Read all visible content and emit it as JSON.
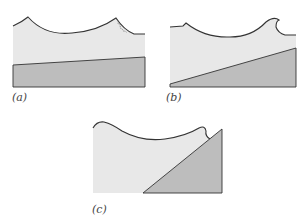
{
  "figure": {
    "colors": {
      "water": "#e8e8e8",
      "seabed": "#bdbdbd",
      "outline": "#333333",
      "background": "#ffffff"
    },
    "panels": [
      {
        "id": "a",
        "label": "(a)",
        "wave_type": "spilling",
        "slope": "gentle"
      },
      {
        "id": "b",
        "label": "(b)",
        "wave_type": "plunging",
        "slope": "moderate"
      },
      {
        "id": "c",
        "label": "(c)",
        "wave_type": "surging",
        "slope": "steep"
      }
    ]
  }
}
